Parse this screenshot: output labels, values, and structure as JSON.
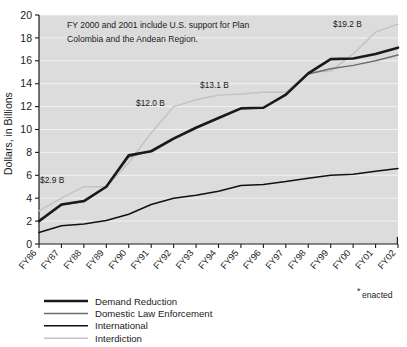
{
  "chart_data": {
    "type": "line",
    "title": "",
    "xlabel": "",
    "ylabel": "Dollars, in Billions",
    "ylim": [
      0,
      20
    ],
    "ytick_step": 2,
    "grid": true,
    "legend_position": "below-left",
    "categories": [
      "FY86",
      "FY87",
      "FY88",
      "FY89",
      "FY90",
      "FY91",
      "FY92",
      "FY93",
      "FY94",
      "FY95",
      "FY96",
      "FY97",
      "FY98",
      "FY99",
      "FY00",
      "FY01",
      "FY02"
    ],
    "yticks": [
      "0",
      "2",
      "4",
      "6",
      "8",
      "10",
      "12",
      "14",
      "16",
      "18",
      "20"
    ],
    "series": [
      {
        "name": "Demand Reduction",
        "color": "#1a1a1a",
        "width": 2.6,
        "values": [
          2.0,
          3.45,
          3.75,
          5.0,
          7.75,
          8.1,
          9.2,
          10.15,
          11.0,
          11.85,
          11.9,
          13.05,
          14.9,
          16.15,
          16.2,
          16.6,
          17.15
        ]
      },
      {
        "name": "Domestic Law Enforcement",
        "color": "#6e6e6e",
        "width": 1.5,
        "values": [
          2.0,
          3.4,
          3.7,
          5.0,
          7.6,
          8.15,
          9.25,
          10.2,
          11.0,
          11.8,
          11.9,
          13.0,
          14.85,
          15.3,
          15.6,
          16.0,
          16.5
        ]
      },
      {
        "name": "International",
        "color": "#111111",
        "width": 1.5,
        "values": [
          1.0,
          1.6,
          1.75,
          2.05,
          2.6,
          3.45,
          4.0,
          4.25,
          4.6,
          5.1,
          5.2,
          5.45,
          5.75,
          6.0,
          6.1,
          6.35,
          6.6
        ]
      },
      {
        "name": "Interdiction",
        "color": "#c2c2c2",
        "width": 1.4,
        "values": [
          2.9,
          4.0,
          5.0,
          5.0,
          7.1,
          9.7,
          12.0,
          12.6,
          13.0,
          13.1,
          13.25,
          13.25,
          15.0,
          15.1,
          16.6,
          18.5,
          19.2
        ]
      }
    ],
    "annotations": [
      {
        "name": "note",
        "line1": "FY 2000 and 2001 include U.S. support for Plan",
        "line2": "Colombia and the Andean Region."
      },
      {
        "name": "callout-2-9",
        "text": "$2.9 B",
        "x_pixel": 40,
        "y_pixel": 180
      },
      {
        "name": "callout-12-0",
        "text": "$12.0 B",
        "x_pixel": 136,
        "y_pixel": 103
      },
      {
        "name": "callout-13-1",
        "text": "$13.1 B",
        "x_pixel": 200,
        "y_pixel": 85
      },
      {
        "name": "callout-19-2",
        "text": "$19.2 B",
        "x_pixel": 333,
        "y_pixel": 24
      }
    ],
    "footnote": {
      "marker": "*",
      "text": "enacted"
    },
    "colors": {
      "plot_background": "#dcdcdc",
      "gridline": "#f2f2f2",
      "axis": "#1a1a1a",
      "page_background": "#ffffff"
    }
  },
  "legend": {
    "items": [
      {
        "label": "Demand Reduction"
      },
      {
        "label": "Domestic Law Enforcement"
      },
      {
        "label": "International"
      },
      {
        "label": "Interdiction"
      }
    ]
  }
}
